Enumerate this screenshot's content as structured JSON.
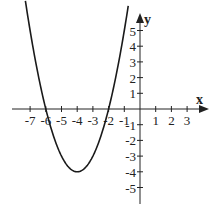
{
  "chart_data": {
    "type": "line",
    "title": "",
    "function": "y = x^2 + 8x + 12",
    "xlabel": "x",
    "ylabel": "y",
    "xlim": [
      -8.8,
      4.2
    ],
    "ylim": [
      -6.2,
      6.0
    ],
    "x_ticks": [
      -7,
      -6,
      -5,
      -4,
      -3,
      -2,
      -1,
      1,
      2,
      3
    ],
    "y_ticks": [
      -5,
      -4,
      -3,
      -2,
      -1,
      1,
      2,
      3,
      4,
      5
    ],
    "grid": false,
    "vertex": [
      -4,
      -4
    ],
    "roots": [
      -6,
      -2
    ],
    "series": [
      {
        "name": "parabola",
        "x": [
          -7.3,
          -7,
          -6.5,
          -6,
          -5.5,
          -5,
          -4.5,
          -4,
          -3.5,
          -3,
          -2.5,
          -2,
          -1.5,
          -1,
          -0.7
        ],
        "values": [
          6.89,
          5,
          2.25,
          0,
          -1.75,
          -3,
          -3.75,
          -4,
          -3.75,
          -3,
          -1.75,
          0,
          2.25,
          5,
          6.89
        ]
      }
    ]
  },
  "layout": {
    "origin_px": [
      140,
      109
    ],
    "unit_px": 15.7,
    "axis_color": "#222222",
    "curve_color": "#1a1a1a"
  }
}
